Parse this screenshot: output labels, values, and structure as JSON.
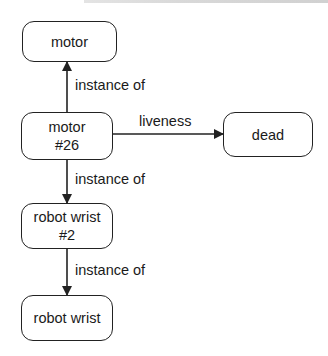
{
  "diagram": {
    "type": "semantic-network",
    "nodes": [
      {
        "id": "motor",
        "label": "motor"
      },
      {
        "id": "motor26",
        "label": "motor\n#26"
      },
      {
        "id": "dead",
        "label": "dead"
      },
      {
        "id": "robotwrist2",
        "label": "robot wrist\n#2"
      },
      {
        "id": "robotwrist",
        "label": "robot wrist"
      }
    ],
    "edges": [
      {
        "from": "motor26",
        "to": "motor",
        "label": "instance of"
      },
      {
        "from": "motor26",
        "to": "dead",
        "label": "liveness"
      },
      {
        "from": "motor26",
        "to": "robotwrist2",
        "label": "instance of"
      },
      {
        "from": "robotwrist2",
        "to": "robotwrist",
        "label": "instance of"
      }
    ],
    "colors": {
      "stroke": "#222222",
      "background": "#ffffff",
      "text": "#1a1a1a"
    }
  }
}
